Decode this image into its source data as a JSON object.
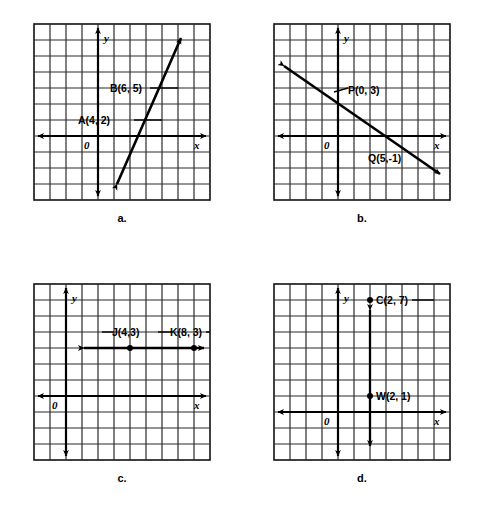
{
  "figure": {
    "title": "",
    "background_color": "#ffffff",
    "ink_color": "#000000",
    "grid_color": "#1a1a1a",
    "width": 484,
    "height": 512
  },
  "panels": [
    {
      "id": "a",
      "caption": "a.",
      "grid": {
        "cols": 11,
        "rows": 11,
        "cell": 16,
        "x_axis_row": 7,
        "y_axis_col": 4
      },
      "axis_labels": {
        "x": "x",
        "y": "y",
        "origin": "0"
      },
      "graph_type": "line-through-two-points",
      "points": [
        {
          "name": "A",
          "label": "A(4, 2)",
          "x": 4,
          "y": 2,
          "label_side": "left"
        },
        {
          "name": "B",
          "label": "B(6, 5)",
          "x": 6,
          "y": 5,
          "label_side": "left"
        }
      ],
      "line": {
        "slope": 1.5,
        "intercept": -4,
        "arrows": "both"
      }
    },
    {
      "id": "b",
      "caption": "b.",
      "grid": {
        "cols": 11,
        "rows": 11,
        "cell": 16,
        "x_axis_row": 7,
        "y_axis_col": 4
      },
      "axis_labels": {
        "x": "x",
        "y": "y",
        "origin": "0"
      },
      "graph_type": "line-through-two-points",
      "points": [
        {
          "name": "P",
          "label": "P(0, 3)",
          "x": 0,
          "y": 3,
          "label_side": "right"
        },
        {
          "name": "Q",
          "label": "Q(5,-1)",
          "x": 5,
          "y": -1,
          "label_side": "below-left"
        }
      ],
      "line": {
        "slope": -0.8,
        "intercept": 3,
        "arrows": "both"
      }
    },
    {
      "id": "c",
      "caption": "c.",
      "grid": {
        "cols": 11,
        "rows": 11,
        "cell": 16,
        "x_axis_row": 7,
        "y_axis_col": 2
      },
      "axis_labels": {
        "x": "x",
        "y": "y",
        "origin": "0"
      },
      "graph_type": "horizontal-line",
      "points": [
        {
          "name": "J",
          "label": "J(4,3)",
          "x": 4,
          "y": 3,
          "label_side": "above-left"
        },
        {
          "name": "K",
          "label": "K(8, 3)",
          "x": 8,
          "y": 3,
          "label_side": "above-right"
        }
      ],
      "line": {
        "constant_y": 3,
        "arrows": "both"
      }
    },
    {
      "id": "d",
      "caption": "d.",
      "grid": {
        "cols": 11,
        "rows": 11,
        "cell": 16,
        "x_axis_row": 8,
        "y_axis_col": 4
      },
      "axis_labels": {
        "x": "x",
        "y": "y",
        "origin": "0"
      },
      "graph_type": "vertical-line",
      "points": [
        {
          "name": "C",
          "label": "C(2, 7)",
          "x": 2,
          "y": 7,
          "label_side": "right"
        },
        {
          "name": "W",
          "label": "W(2, 1)",
          "x": 2,
          "y": 1,
          "label_side": "right"
        }
      ],
      "line": {
        "constant_x": 2,
        "arrows": "both"
      }
    }
  ]
}
